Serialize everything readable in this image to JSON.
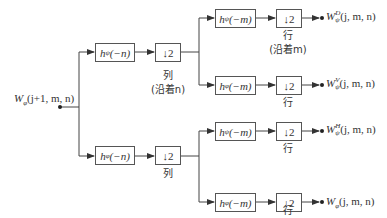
{
  "diagram": {
    "type": "2D fast wavelet transform analysis filter bank",
    "input": {
      "symbol": "W",
      "subscript": "φ",
      "args": "(j+1, m, n)"
    },
    "stage1": [
      {
        "filter": {
          "h_sub": "ψ",
          "arg": "(−n)"
        },
        "downsample": "↓2",
        "label": "列",
        "label2": "(沿着n)"
      },
      {
        "filter": {
          "h_sub": "φ",
          "arg": "(−n)"
        },
        "downsample": "↓2",
        "label": "列"
      }
    ],
    "stage2": [
      {
        "filter": {
          "h_sub": "ψ",
          "arg": "(−m)"
        },
        "downsample": "↓2",
        "label": "行",
        "label2": "(沿着m)",
        "output": {
          "symbol": "W",
          "sup": "D",
          "sub": "ψ",
          "args": "(j, m, n)"
        }
      },
      {
        "filter": {
          "h_sub": "φ",
          "arg": "(−m)"
        },
        "downsample": "↓2",
        "label": "行",
        "output": {
          "symbol": "W",
          "sup": "V",
          "sub": "ψ",
          "args": "(j, m, n)"
        }
      },
      {
        "filter": {
          "h_sub": "ψ",
          "arg": "(−m)"
        },
        "downsample": "↓2",
        "label": "行",
        "output": {
          "symbol": "W",
          "sup": "H",
          "sub": "ψ",
          "args": "(j, m, n)"
        }
      },
      {
        "filter": {
          "h_sub": "φ",
          "arg": "(−m)"
        },
        "downsample": "↓2",
        "label": "行",
        "output": {
          "symbol": "W",
          "sup": "",
          "sub": "φ",
          "args": "(j, m, n)"
        }
      }
    ],
    "colors": {
      "line": "#444444",
      "box_border": "#555555",
      "text": "#333333"
    }
  }
}
